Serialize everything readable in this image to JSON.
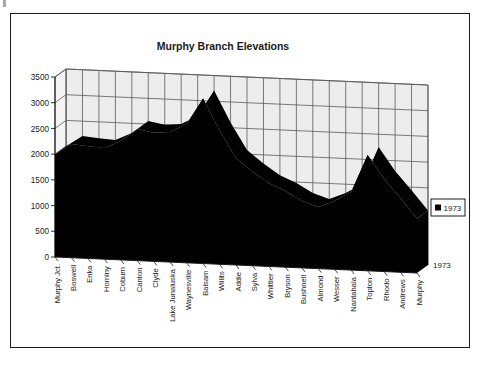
{
  "chart_data": {
    "type": "area",
    "title": "Murphy Branch Elevations",
    "xlabel": "",
    "ylabel": "",
    "zlabel": "1973",
    "ylim": [
      0,
      3500
    ],
    "ytick_step": 500,
    "yticks": [
      "0",
      "500",
      "1000",
      "1500",
      "2000",
      "2500",
      "3000",
      "3500"
    ],
    "grid": true,
    "legend_position": "right",
    "legend_entries": [
      "1973"
    ],
    "series_name": "1973",
    "series_color": "#000000",
    "categories": [
      "Murphy Jct.",
      "Boswell",
      "Enka",
      "Hominy",
      "Coburn",
      "Canton",
      "Clyde",
      "Lake Junaluska",
      "Waynesville",
      "Balsam",
      "Willits",
      "Addie",
      "Sylva",
      "Whittier",
      "Bryson",
      "Bushnell",
      "Almond",
      "Wesser",
      "Nantahala",
      "Topton",
      "Rhodo",
      "Andrews",
      "Murphy"
    ],
    "values": [
      2000,
      2210,
      2180,
      2160,
      2310,
      2560,
      2500,
      2530,
      2700,
      3210,
      2600,
      2080,
      1830,
      1620,
      1480,
      1300,
      1200,
      1330,
      1520,
      2250,
      1800,
      1440,
      1060
    ],
    "series": [
      {
        "name": "1973",
        "values": [
          2000,
          2210,
          2180,
          2160,
          2310,
          2560,
          2500,
          2530,
          2700,
          3210,
          2600,
          2080,
          1830,
          1620,
          1480,
          1300,
          1200,
          1330,
          1520,
          2250,
          1800,
          1440,
          1060
        ]
      }
    ]
  },
  "legend": {
    "marker_color": "#000000",
    "label": "1973"
  },
  "axis": {
    "z_label": "1973"
  },
  "colors": {
    "frame": "#1a1a1a",
    "wall": "#ededed",
    "floor": "#e4e4e4",
    "gridline": "#5a5a5a",
    "area": "#000000",
    "text": "#1a1a1a"
  }
}
